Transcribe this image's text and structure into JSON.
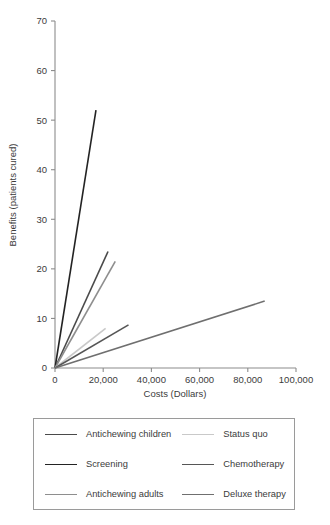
{
  "chart_data": {
    "type": "line",
    "title": "",
    "xlabel": "Costs (Dollars)",
    "ylabel": "Benefits (patients cured)",
    "xlim": [
      0,
      100000
    ],
    "ylim": [
      0,
      70
    ],
    "xticks": [
      0,
      20000,
      40000,
      60000,
      80000,
      100000
    ],
    "xtick_labels": [
      "0",
      "20,000",
      "40,000",
      "60,000",
      "80,000",
      "100,000"
    ],
    "yticks": [
      0,
      10,
      20,
      30,
      40,
      50,
      60,
      70
    ],
    "ytick_labels": [
      "0",
      "10",
      "20",
      "30",
      "40",
      "50",
      "60",
      "70"
    ],
    "grid": false,
    "legend_position": "below",
    "series": [
      {
        "name": "Antichewing children",
        "color": "#4a4a4a",
        "x": [
          0,
          22000
        ],
        "y": [
          0,
          23.5
        ],
        "legend_column": "left",
        "legend_row": 1
      },
      {
        "name": "Screening",
        "color": "#232323",
        "x": [
          0,
          17000
        ],
        "y": [
          0,
          52.0
        ],
        "legend_column": "left",
        "legend_row": 2
      },
      {
        "name": "Antichewing adults",
        "color": "#8e8e8e",
        "x": [
          0,
          25000
        ],
        "y": [
          0,
          21.5
        ],
        "legend_column": "left",
        "legend_row": 3
      },
      {
        "name": "Status quo",
        "color": "#c9c9c9",
        "x": [
          0,
          21000
        ],
        "y": [
          0,
          8.0
        ],
        "legend_column": "right",
        "legend_row": 1
      },
      {
        "name": "Chemotherapy",
        "color": "#565656",
        "x": [
          0,
          30500
        ],
        "y": [
          0,
          8.7
        ],
        "legend_column": "right",
        "legend_row": 2
      },
      {
        "name": "Deluxe therapy",
        "color": "#6f6f6f",
        "x": [
          0,
          87000
        ],
        "y": [
          0,
          13.5
        ],
        "legend_column": "right",
        "legend_row": 3
      }
    ]
  },
  "axis": {
    "line_color": "#8c8c8c",
    "tick_color": "#8c8c8c",
    "text_color": "#3b3b3b"
  },
  "legend": {
    "items": [
      {
        "label": "Antichewing children",
        "color": "#4a4a4a"
      },
      {
        "label": "Status quo",
        "color": "#c9c9c9"
      },
      {
        "label": "Screening",
        "color": "#232323"
      },
      {
        "label": "Chemotherapy",
        "color": "#565656"
      },
      {
        "label": "Antichewing adults",
        "color": "#8e8e8e"
      },
      {
        "label": "Deluxe therapy",
        "color": "#6f6f6f"
      }
    ]
  }
}
